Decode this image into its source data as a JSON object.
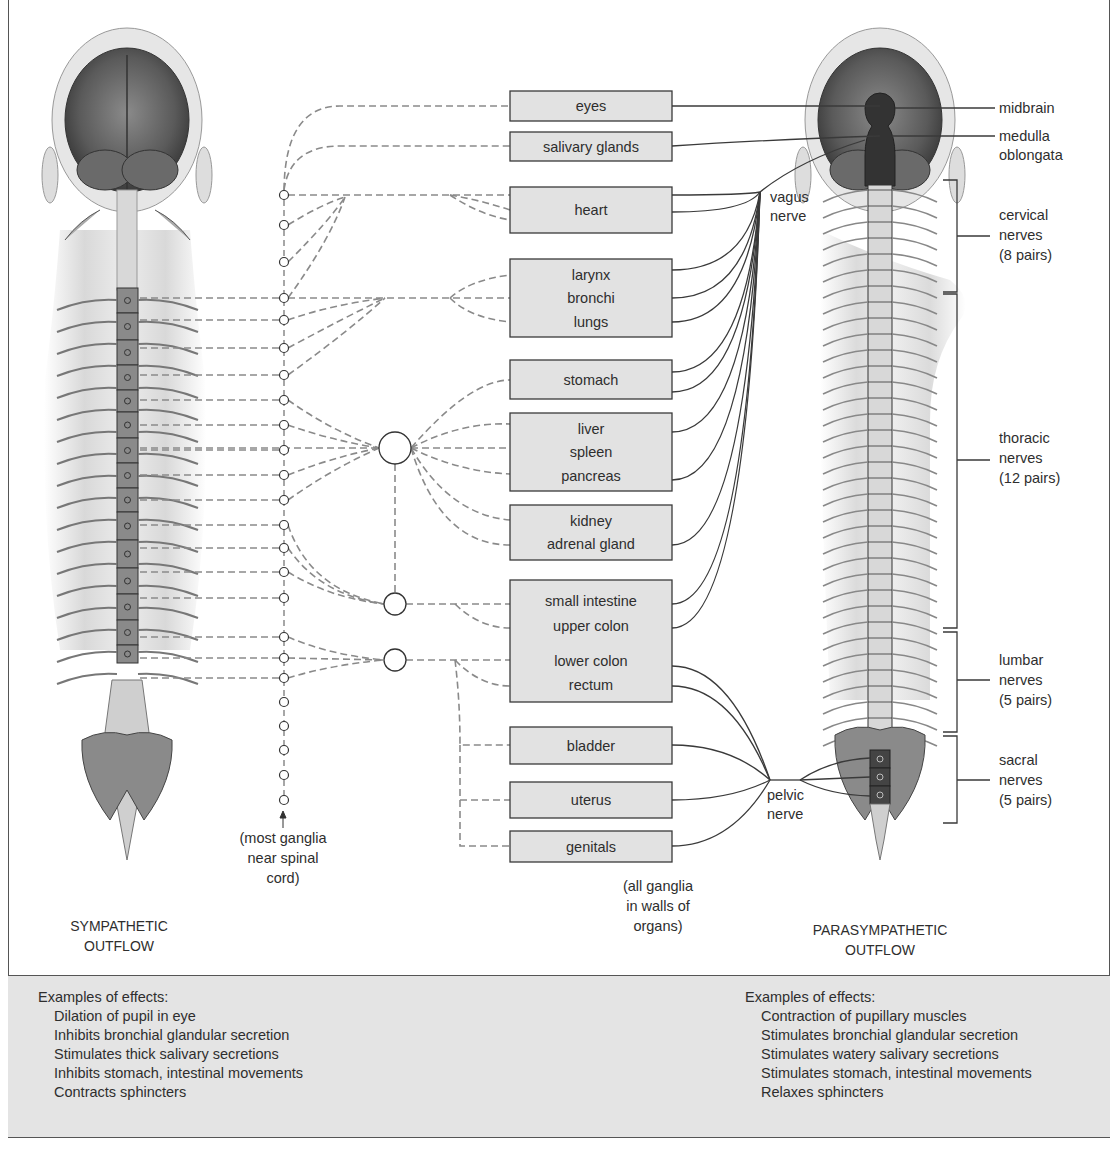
{
  "titles": {
    "sympathetic": [
      "SYMPATHETIC",
      "OUTFLOW"
    ],
    "parasympathetic": [
      "PARASYMPATHETIC",
      "OUTFLOW"
    ]
  },
  "organs": [
    {
      "id": "eyes",
      "lines": [
        "eyes"
      ],
      "box": [
        510,
        91,
        162,
        30
      ]
    },
    {
      "id": "salivary",
      "lines": [
        "salivary glands"
      ],
      "box": [
        510,
        132,
        162,
        29
      ]
    },
    {
      "id": "heart",
      "lines": [
        "heart"
      ],
      "box": [
        510,
        187,
        162,
        46
      ]
    },
    {
      "id": "lungs",
      "lines": [
        "larynx",
        "bronchi",
        "lungs"
      ],
      "box": [
        510,
        259,
        162,
        78
      ]
    },
    {
      "id": "stomach",
      "lines": [
        "stomach"
      ],
      "box": [
        510,
        360,
        162,
        39
      ]
    },
    {
      "id": "liver",
      "lines": [
        "liver",
        "spleen",
        "pancreas"
      ],
      "box": [
        510,
        413,
        162,
        78
      ]
    },
    {
      "id": "kidney",
      "lines": [
        "kidney",
        "adrenal gland"
      ],
      "box": [
        510,
        505,
        162,
        55
      ]
    },
    {
      "id": "intestine",
      "lines": [
        "small intestine",
        "upper colon",
        "lower colon",
        "rectum"
      ],
      "box": [
        510,
        580,
        162,
        122
      ]
    },
    {
      "id": "bladder",
      "lines": [
        "bladder"
      ],
      "box": [
        510,
        727,
        162,
        37
      ]
    },
    {
      "id": "uterus",
      "lines": [
        "uterus"
      ],
      "box": [
        510,
        782,
        162,
        36
      ]
    },
    {
      "id": "genitals",
      "lines": [
        "genitals"
      ],
      "box": [
        510,
        831,
        162,
        31
      ]
    }
  ],
  "right_labels": {
    "midbrain": "midbrain",
    "medulla": [
      "medulla",
      "oblongata"
    ],
    "cervical": [
      "cervical",
      "nerves",
      "(8 pairs)"
    ],
    "thoracic": [
      "thoracic",
      "nerves",
      "(12 pairs)"
    ],
    "lumbar": [
      "lumbar",
      "nerves",
      "(5 pairs)"
    ],
    "sacral": [
      "sacral",
      "nerves",
      "(5 pairs)"
    ]
  },
  "nerve_labels": {
    "vagus": [
      "vagus",
      "nerve"
    ],
    "pelvic": [
      "pelvic",
      "nerve"
    ]
  },
  "notes": {
    "sympathetic_ganglia": [
      "(most ganglia",
      "near spinal",
      "cord)"
    ],
    "parasympathetic_ganglia": [
      "(all ganglia",
      "in walls of",
      "organs)"
    ]
  },
  "effects": {
    "sympathetic": {
      "heading": "Examples of effects:",
      "items": [
        "Dilation of pupil in eye",
        "Inhibits bronchial glandular secretion",
        "Stimulates thick salivary secretions",
        "Inhibits stomach, intestinal movements",
        "Contracts sphincters"
      ]
    },
    "parasympathetic": {
      "heading": "Examples of effects:",
      "items": [
        "Contraction of pupillary muscles",
        "Stimulates bronchial glandular secretion",
        "Stimulates watery salivary secretions",
        "Stimulates stomach, intestinal movements",
        "Relaxes sphincters"
      ]
    }
  },
  "colors": {
    "box_fill": "#e2e2e2",
    "box_stroke": "#3a3a3a",
    "dashed_line": "#8a8a8a",
    "solid_line": "#3a3a3a",
    "effects_bg": "#e4e4e4",
    "brainstem": "#333333"
  }
}
